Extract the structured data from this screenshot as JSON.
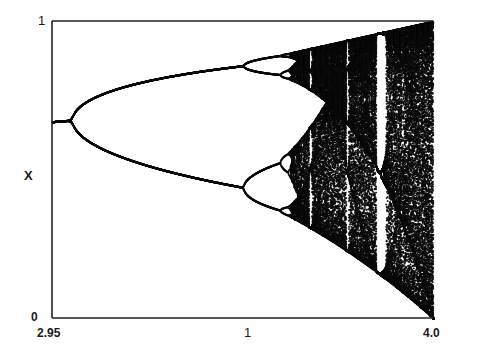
{
  "chart_data": {
    "type": "scatter",
    "title": "",
    "subtitle": "",
    "xlabel": "",
    "ylabel": "X",
    "xlim": [
      2.95,
      4.0
    ],
    "ylim": [
      0,
      1
    ],
    "x_tick_labels": [
      "2.95",
      "1",
      "4.0"
    ],
    "y_tick_labels": [
      "0",
      "1"
    ],
    "grid": false,
    "legend": null,
    "features": {
      "fixed_point_branch": {
        "r_start": 2.95,
        "r_end": 3.0,
        "x": 0.66
      },
      "period_doubling_1": {
        "r": 3.0,
        "x": 0.667
      },
      "period_doubling_2": {
        "r": 3.449,
        "x_upper": 0.85,
        "x_lower": 0.44
      },
      "period_doubling_3": {
        "r": 3.544
      },
      "onset_of_chaos": {
        "r": 3.57
      },
      "periodic_windows_r": [
        3.63,
        3.74,
        3.83
      ],
      "chaotic_band_upper_bound_at_r4": 1.0,
      "chaotic_band_lower_bound_at_r4": 0.0
    },
    "colors": {
      "ink": "#0d0d0d",
      "background": "#ffffff"
    }
  },
  "axes": {
    "y_top": "1",
    "y_bottom": "0",
    "y_label": "X",
    "x_left": "2.95",
    "x_mid": "1",
    "x_right": "4.0"
  }
}
